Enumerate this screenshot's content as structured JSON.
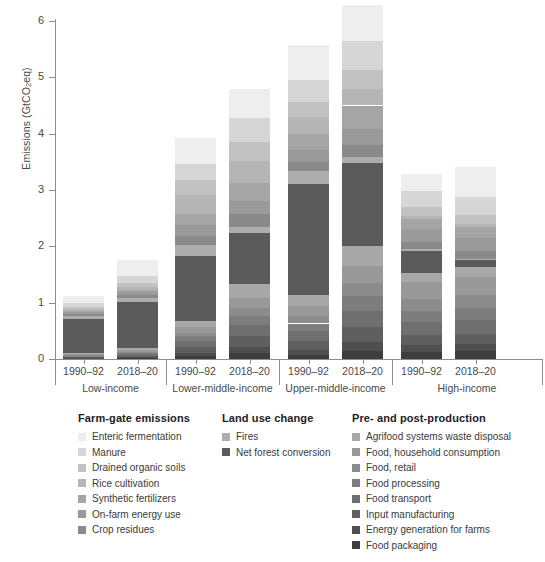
{
  "chart_data": {
    "type": "bar",
    "subtype": "stacked",
    "title": "",
    "xlabel": "",
    "ylabel": "Emissions (GtCO2eq)",
    "ylim": [
      0,
      6
    ],
    "yticks": [
      0,
      1,
      2,
      3,
      4,
      5,
      6
    ],
    "ytick_labels": [
      "0",
      "1",
      "2",
      "3",
      "4",
      "5",
      "6"
    ],
    "grid": false,
    "legend_position": "below",
    "groups": [
      "Low-income",
      "Lower-middle-income",
      "Upper-middle-income",
      "High-income"
    ],
    "periods": [
      "1990-92",
      "2018-20"
    ],
    "categories": [
      "Low-income 1990-92",
      "Low-income 2018-20",
      "Lower-middle-income 1990-92",
      "Lower-middle-income 2018-20",
      "Upper-middle-income 1990-92",
      "Upper-middle-income 2018-20",
      "High-income 1990-92",
      "High-income 2018-20"
    ],
    "totals": [
      1.12,
      1.75,
      3.92,
      4.8,
      5.57,
      5.98,
      3.28,
      3.41
    ],
    "series": [
      {
        "name": "Food packaging",
        "color": "#3d3d3d",
        "values": [
          0.01,
          0.02,
          0.05,
          0.1,
          0.07,
          0.14,
          0.13,
          0.14
        ]
      },
      {
        "name": "Energy generation for farms",
        "color": "#4f4f4f",
        "values": [
          0.01,
          0.02,
          0.06,
          0.12,
          0.09,
          0.16,
          0.12,
          0.13
        ]
      },
      {
        "name": "Input manufacturing",
        "color": "#5f5f5f",
        "values": [
          0.01,
          0.02,
          0.1,
          0.18,
          0.16,
          0.26,
          0.17,
          0.18
        ]
      },
      {
        "name": "Food transport",
        "color": "#6f6f6f",
        "values": [
          0.02,
          0.03,
          0.11,
          0.21,
          0.18,
          0.3,
          0.23,
          0.24
        ]
      },
      {
        "name": "Food processing",
        "color": "#7d7d7d",
        "values": [
          0.01,
          0.02,
          0.08,
          0.16,
          0.13,
          0.25,
          0.2,
          0.21
        ]
      },
      {
        "name": "Food, retail",
        "color": "#8c8c8c",
        "values": [
          0.01,
          0.02,
          0.07,
          0.14,
          0.14,
          0.24,
          0.22,
          0.23
        ]
      },
      {
        "name": "Food, household consumption",
        "color": "#999999",
        "values": [
          0.02,
          0.03,
          0.09,
          0.18,
          0.17,
          0.3,
          0.3,
          0.32
        ]
      },
      {
        "name": "Agrifood systems waste disposal",
        "color": "#a8a8a8",
        "values": [
          0.02,
          0.04,
          0.12,
          0.24,
          0.2,
          0.35,
          0.16,
          0.18
        ]
      },
      {
        "name": "Net forest conversion",
        "color": "#5a5a5a",
        "values": [
          0.6,
          0.82,
          1.15,
          0.9,
          1.97,
          1.48,
          0.38,
          0.12
        ]
      },
      {
        "name": "Fires",
        "color": "#adadad",
        "values": [
          0.05,
          0.06,
          0.2,
          0.12,
          0.22,
          0.1,
          0.05,
          0.03
        ]
      },
      {
        "name": "Crop residues",
        "color": "#8a8a8a",
        "values": [
          0.03,
          0.05,
          0.16,
          0.22,
          0.16,
          0.22,
          0.12,
          0.13
        ]
      },
      {
        "name": "On-farm energy use",
        "color": "#9a9a9a",
        "values": [
          0.04,
          0.06,
          0.18,
          0.24,
          0.22,
          0.28,
          0.22,
          0.23
        ]
      },
      {
        "name": "Synthetic fertilizers",
        "color": "#a5a5a5",
        "values": [
          0.02,
          0.04,
          0.21,
          0.32,
          0.28,
          0.42,
          0.19,
          0.2
        ]
      },
      {
        "name": "Rice cultivation",
        "color": "#b5b5b5",
        "values": [
          0.03,
          0.05,
          0.34,
          0.38,
          0.3,
          0.3,
          0.05,
          0.05
        ]
      },
      {
        "name": "Drained organic soils",
        "color": "#c2c2c2",
        "values": [
          0.04,
          0.07,
          0.26,
          0.34,
          0.27,
          0.33,
          0.16,
          0.17
        ]
      },
      {
        "name": "Manure",
        "color": "#d6d6d6",
        "values": [
          0.08,
          0.13,
          0.29,
          0.43,
          0.4,
          0.51,
          0.29,
          0.31
        ]
      },
      {
        "name": "Enteric fermentation",
        "color": "#eeeeee",
        "values": [
          0.12,
          0.27,
          0.45,
          0.52,
          0.61,
          0.64,
          0.29,
          0.54
        ]
      }
    ]
  },
  "axis": {
    "ylabel_text": "Emissions (GtCO",
    "ylabel_sub": "2",
    "ylabel_tail": "eq)",
    "yticks": [
      "6",
      "5",
      "4",
      "3",
      "2",
      "1",
      "0"
    ]
  },
  "xaxis": {
    "groups": [
      {
        "name": "Low-income",
        "periods": [
          "1990–92",
          "2018–20"
        ]
      },
      {
        "name": "Lower-middle-income",
        "periods": [
          "1990–92",
          "2018–20"
        ]
      },
      {
        "name": "Upper-middle-income",
        "periods": [
          "1990–92",
          "2018–20"
        ]
      },
      {
        "name": "High-income",
        "periods": [
          "1990–92",
          "2018–20"
        ]
      }
    ]
  },
  "legend": {
    "columns": [
      {
        "title": "Farm-gate emissions",
        "items": [
          {
            "label": "Enteric fermentation",
            "color": "#eeeeee"
          },
          {
            "label": "Manure",
            "color": "#d6d6d6"
          },
          {
            "label": "Drained organic soils",
            "color": "#c2c2c2"
          },
          {
            "label": "Rice cultivation",
            "color": "#b5b5b5"
          },
          {
            "label": "Synthetic fertilizers",
            "color": "#a5a5a5"
          },
          {
            "label": "On-farm energy use",
            "color": "#9a9a9a"
          },
          {
            "label": "Crop residues",
            "color": "#8a8a8a"
          }
        ]
      },
      {
        "title": "Land use change",
        "items": [
          {
            "label": "Fires",
            "color": "#adadad"
          },
          {
            "label": "Net forest conversion",
            "color": "#5a5a5a"
          }
        ]
      },
      {
        "title": "Pre- and post-production",
        "items": [
          {
            "label": "Agrifood systems waste disposal",
            "color": "#a8a8a8"
          },
          {
            "label": "Food, household consumption",
            "color": "#999999"
          },
          {
            "label": "Food, retail",
            "color": "#8c8c8c"
          },
          {
            "label": "Food processing",
            "color": "#7d7d7d"
          },
          {
            "label": "Food transport",
            "color": "#6f6f6f"
          },
          {
            "label": "Input manufacturing",
            "color": "#5f5f5f"
          },
          {
            "label": "Energy generation for farms",
            "color": "#4f4f4f"
          },
          {
            "label": "Food packaging",
            "color": "#3d3d3d"
          }
        ]
      }
    ]
  }
}
